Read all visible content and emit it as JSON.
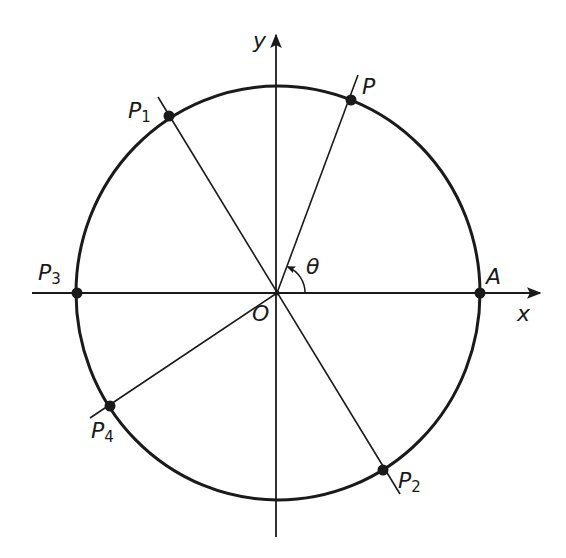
{
  "diagram": {
    "type": "unit-circle-angle-diagram",
    "axes": {
      "x_label": "x",
      "y_label": "y",
      "origin_label": "O"
    },
    "angle_label": "θ",
    "points": [
      {
        "id": "A",
        "label": "A",
        "sub": ""
      },
      {
        "id": "P",
        "label": "P",
        "sub": ""
      },
      {
        "id": "P1",
        "label": "P",
        "sub": "1"
      },
      {
        "id": "P2",
        "label": "P",
        "sub": "2"
      },
      {
        "id": "P3",
        "label": "P",
        "sub": "3"
      },
      {
        "id": "P4",
        "label": "P",
        "sub": "4"
      }
    ],
    "colors": {
      "stroke": "#1a1a1a",
      "background": "#ffffff"
    }
  }
}
